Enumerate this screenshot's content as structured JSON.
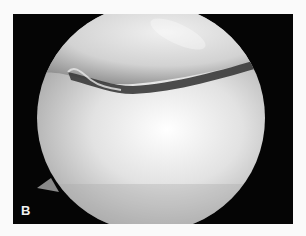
{
  "figure": {
    "panel_label": "B",
    "colors": {
      "background": "#fafafa",
      "frame": "#050505",
      "tissue_light": "#f4f4f4",
      "tissue_mid": "#b8b8b8",
      "gap": "#3a3a3a",
      "label": "#f2f2f2"
    }
  }
}
